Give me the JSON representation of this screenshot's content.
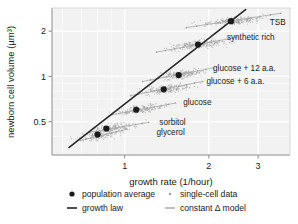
{
  "chart_data": {
    "type": "scatter",
    "title": "",
    "xlabel": "growth rate (1/hour)",
    "ylabel": "newborn cell volume (µm³)",
    "xscale": "log",
    "yscale": "log",
    "xlim": [
      0.55,
      3.9
    ],
    "ylim": [
      0.3,
      2.85
    ],
    "xticks": [
      1,
      2,
      3
    ],
    "xticklabels": [
      "1",
      "2",
      "3"
    ],
    "yticks": [
      0.5,
      1,
      2
    ],
    "yticklabels": [
      "0.5",
      "1",
      "2"
    ],
    "grid": true,
    "legend_position": "below-axes",
    "series": [
      {
        "name": "population average",
        "marker": "filled-circle",
        "color": "#1a1a1a",
        "x": [
          0.8,
          0.86,
          1.1,
          1.38,
          1.56,
          1.83,
          2.4
        ],
        "y": [
          0.41,
          0.45,
          0.6,
          0.82,
          1.02,
          1.63,
          2.33
        ],
        "condition_labels": [
          "glycerol",
          "sorbitol",
          "glucose",
          "glucose + 6 a.a.",
          "glucose + 12 a.a.",
          "synthetic rich",
          "TSB"
        ]
      },
      {
        "name": "growth law",
        "type": "line",
        "color": "#262626",
        "x": [
          0.63,
          2.72
        ],
        "y": [
          0.335,
          2.8
        ]
      }
    ],
    "conditions": [
      {
        "label": "glycerol",
        "label_x": 1.3,
        "label_y": 0.405,
        "pop_x": 0.8,
        "pop_y": 0.41,
        "model_x": [
          0.695,
          1.02
        ],
        "model_y": [
          0.375,
          0.445
        ],
        "cloud_center_x": 0.82,
        "cloud_center_y": 0.405,
        "cloud_spread_x": 0.14,
        "cloud_spread_y": 0.035
      },
      {
        "label": "sorbitol",
        "label_x": 1.33,
        "label_y": 0.475,
        "pop_x": 0.86,
        "pop_y": 0.45,
        "model_x": [
          0.75,
          1.22
        ],
        "model_y": [
          0.425,
          0.495
        ],
        "cloud_center_x": 0.92,
        "cloud_center_y": 0.455,
        "cloud_spread_x": 0.17,
        "cloud_spread_y": 0.04
      },
      {
        "label": "glucose",
        "label_x": 1.62,
        "label_y": 0.645,
        "pop_x": 1.1,
        "pop_y": 0.6,
        "model_x": [
          0.9,
          1.52
        ],
        "model_y": [
          0.555,
          0.665
        ],
        "cloud_center_x": 1.14,
        "cloud_center_y": 0.605,
        "cloud_spread_x": 0.22,
        "cloud_spread_y": 0.05
      },
      {
        "label": "glucose + 6 a.a.",
        "label_x": 1.96,
        "label_y": 0.885,
        "pop_x": 1.38,
        "pop_y": 0.82,
        "model_x": [
          1.05,
          1.9
        ],
        "model_y": [
          0.745,
          0.925
        ],
        "cloud_center_x": 1.42,
        "cloud_center_y": 0.825,
        "cloud_spread_x": 0.3,
        "cloud_spread_y": 0.07
      },
      {
        "label": "glucose + 12 a.a.",
        "label_x": 2.07,
        "label_y": 1.085,
        "pop_x": 1.56,
        "pop_y": 1.02,
        "model_x": [
          1.16,
          2.08
        ],
        "model_y": [
          0.925,
          1.14
        ],
        "cloud_center_x": 1.58,
        "cloud_center_y": 1.025,
        "cloud_spread_x": 0.32,
        "cloud_spread_y": 0.085
      },
      {
        "label": "synthetic rich",
        "label_x": 2.32,
        "label_y": 1.74,
        "pop_x": 1.83,
        "pop_y": 1.63,
        "model_x": [
          1.3,
          2.52
        ],
        "model_y": [
          1.45,
          1.82
        ],
        "cloud_center_x": 1.84,
        "cloud_center_y": 1.635,
        "cloud_spread_x": 0.44,
        "cloud_spread_y": 0.13
      },
      {
        "label": "TSB",
        "label_x": 3.3,
        "label_y": 2.21,
        "pop_x": 2.4,
        "pop_y": 2.33,
        "model_x": [
          1.66,
          3.62
        ],
        "model_y": [
          2.11,
          2.63
        ],
        "cloud_center_x": 2.45,
        "cloud_center_y": 2.33,
        "cloud_spread_x": 0.62,
        "cloud_spread_y": 0.17
      }
    ],
    "legend": [
      {
        "key": "population-average",
        "label": "population average",
        "marker": "filled-circle",
        "color": "#1a1a1a"
      },
      {
        "key": "growth-law",
        "label": "growth law",
        "marker": "line",
        "color": "#262626"
      },
      {
        "key": "single-cell-data",
        "label": "single-cell data",
        "marker": "small-dot",
        "color": "#9a9a9a"
      },
      {
        "key": "constant-delta-model",
        "label": "constant Δ model",
        "marker": "line",
        "color": "#b0b0b0"
      }
    ],
    "colors": {
      "plot_background": "#f2f2f2",
      "gridline": "#ffffff",
      "axis": "#8c8c8c",
      "population_marker": "#1a1a1a",
      "growth_law_line": "#262626",
      "single_cell_point": "#9a9a9a",
      "constant_delta_line": "#b0b0b0",
      "text": "#1a1a1a"
    }
  }
}
